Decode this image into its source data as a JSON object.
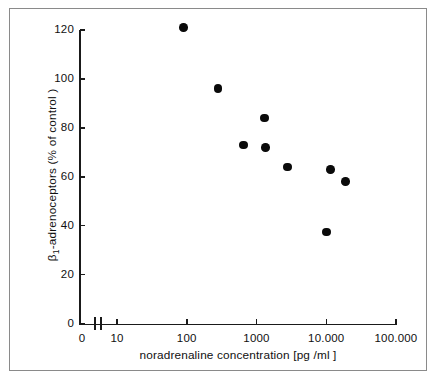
{
  "chart_data": {
    "type": "scatter",
    "title": "",
    "xlabel": "noradrenaline concentration  [pg /ml ]",
    "ylabel": "β1-adrenoceptors  (% of control )",
    "ylabel_base": "β",
    "ylabel_sub": "1",
    "ylabel_rest": "-adrenoceptors  (% of control )",
    "xscale": "log",
    "yscale": "linear",
    "xlim": [
      10,
      100000
    ],
    "ylim": [
      0,
      120
    ],
    "grid": false,
    "legend": false,
    "axis_break": true,
    "axis_break_note": "x-axis broken between 0 and 10",
    "x_tick_labels": [
      "0",
      "10",
      "100",
      "1000",
      "10.000",
      "100.000"
    ],
    "x_tick_values": [
      0,
      10,
      100,
      1000,
      10000,
      100000
    ],
    "y_tick_labels": [
      "0",
      "20",
      "40",
      "60",
      "80",
      "100",
      "120"
    ],
    "y_tick_values": [
      0,
      20,
      40,
      60,
      80,
      100,
      120
    ],
    "series": [
      {
        "name": "β1-adrenoceptors vs noradrenaline",
        "marker": "filled-circle",
        "color": "#0a0a0a",
        "points": [
          {
            "x": 90,
            "y": 121
          },
          {
            "x": 280,
            "y": 96
          },
          {
            "x": 650,
            "y": 73
          },
          {
            "x": 1300,
            "y": 84
          },
          {
            "x": 1350,
            "y": 72
          },
          {
            "x": 2800,
            "y": 64
          },
          {
            "x": 10000,
            "y": 37.5
          },
          {
            "x": 11500,
            "y": 63
          },
          {
            "x": 19000,
            "y": 58
          }
        ]
      }
    ],
    "colors": {
      "marker": "#0a0a0a",
      "axis": "#1a1a1a",
      "text": "#101010",
      "frame": "#8a8a8a",
      "background": "#ffffff"
    }
  },
  "figure": {
    "caption": ""
  }
}
